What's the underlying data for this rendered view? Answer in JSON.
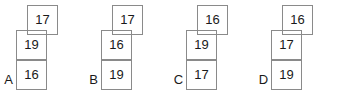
{
  "canvas": {
    "width": 350,
    "height": 99,
    "background": "#ffffff",
    "line_color": "#8a8a8a",
    "text_color": "#1a1a1a"
  },
  "figures": [
    {
      "label": "A",
      "left": 0,
      "top_value": "17",
      "middle_value": "19",
      "bottom_value": "16"
    },
    {
      "label": "B",
      "left": 85,
      "top_value": "17",
      "middle_value": "16",
      "bottom_value": "19"
    },
    {
      "label": "C",
      "left": 170,
      "top_value": "16",
      "middle_value": "19",
      "bottom_value": "17"
    },
    {
      "label": "D",
      "left": 255,
      "top_value": "16",
      "middle_value": "17",
      "bottom_value": "19"
    }
  ]
}
